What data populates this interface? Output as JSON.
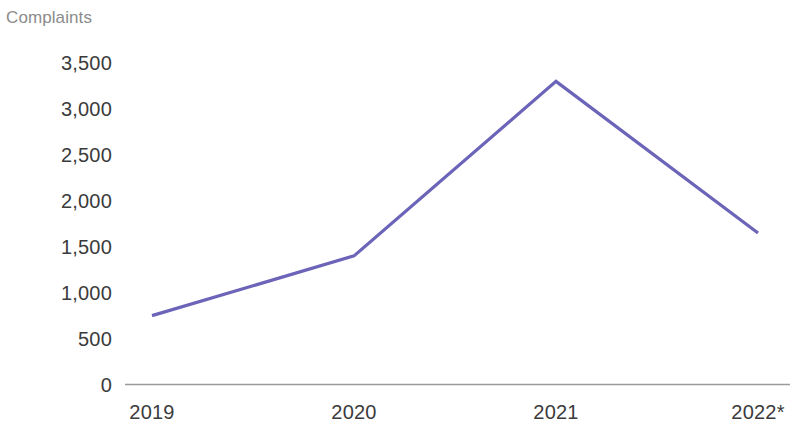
{
  "chart_data": {
    "type": "line",
    "title": "Complaints",
    "xlabel": "",
    "ylabel": "Complaints",
    "categories": [
      "2019",
      "2020",
      "2021",
      "2022*"
    ],
    "series": [
      {
        "name": "Complaints",
        "color": "#6b64b8",
        "values": [
          750,
          1400,
          3300,
          1650
        ]
      }
    ],
    "ylim": [
      0,
      3500
    ],
    "y_ticks": [
      0,
      500,
      1000,
      1500,
      2000,
      2500,
      3000,
      3500
    ],
    "y_tick_labels": [
      "0",
      "500",
      "1,000",
      "1,500",
      "2,000",
      "2,500",
      "3,000",
      "3,500"
    ],
    "x_tick_labels": [
      "2019",
      "2020",
      "2021",
      "2022*"
    ],
    "grid": false,
    "legend": false,
    "legend_position": "none",
    "markers": false,
    "annotations": [
      "* asterisk on 2022 indicates provisional or partial-year figure"
    ],
    "axis_line_color": "#9a9a9a",
    "title_color": "#8b8b8b",
    "tick_label_color": "#3b3b3b",
    "background_color": "#ffffff"
  },
  "axis": {
    "y_labels": [
      {
        "text": "3,500",
        "value": 3500
      },
      {
        "text": "3,000",
        "value": 3000
      },
      {
        "text": "2,500",
        "value": 2500
      },
      {
        "text": "2,000",
        "value": 2000
      },
      {
        "text": "1,500",
        "value": 1500
      },
      {
        "text": "1,000",
        "value": 1000
      },
      {
        "text": "500",
        "value": 500
      },
      {
        "text": "0",
        "value": 0
      }
    ],
    "x_labels": [
      {
        "text": "2019",
        "value": 2019
      },
      {
        "text": "2020",
        "value": 2020
      },
      {
        "text": "2021",
        "value": 2021
      },
      {
        "text": "2022*",
        "value": 2022
      }
    ]
  }
}
